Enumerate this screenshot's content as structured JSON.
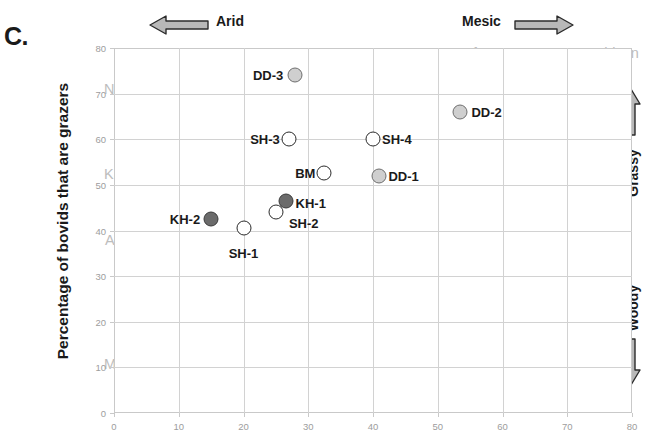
{
  "panel": {
    "letter": "C."
  },
  "axes": {
    "y_title": "Percentage of bovids that are grazers",
    "x_ticks": [
      "0",
      "10",
      "20",
      "30",
      "40",
      "50",
      "60",
      "70",
      "80"
    ],
    "y_ticks": [
      "0",
      "10",
      "20",
      "30",
      "40",
      "50",
      "60",
      "70",
      "80"
    ]
  },
  "annotations": {
    "arid": "Arid",
    "mesic": "Mesic",
    "grassy": "Grassy",
    "woody": "Woody"
  },
  "park_labels": [
    {
      "text": "Ngorongoro",
      "x": 104,
      "y": 81
    },
    {
      "text": "Kalahari",
      "x": 104,
      "y": 166
    },
    {
      "text": "Amboseli",
      "x": 105,
      "y": 232
    },
    {
      "text": "Mkuzi",
      "x": 104,
      "y": 356
    },
    {
      "text": "Chobe",
      "x": 186,
      "y": 194
    },
    {
      "text": "Kruger",
      "x": 176,
      "y": 325
    },
    {
      "text": "Okavango",
      "x": 392,
      "y": 88
    },
    {
      "text": "Kafue",
      "x": 455,
      "y": 45
    },
    {
      "text": "Manyara",
      "x": 504,
      "y": 97
    },
    {
      "text": "Murchison",
      "x": 572,
      "y": 45
    },
    {
      "text": "Falls",
      "x": 592,
      "y": 64
    }
  ],
  "chart_data": {
    "type": "scatter",
    "title": "",
    "xlabel": "",
    "ylabel": "Percentage of bovids that are grazers",
    "xlim": [
      0,
      80
    ],
    "ylim": [
      0,
      80
    ],
    "xticks": [
      0,
      10,
      20,
      30,
      40,
      50,
      60,
      70,
      80
    ],
    "yticks": [
      0,
      10,
      20,
      30,
      40,
      50,
      60,
      70,
      80
    ],
    "grid": true,
    "legend": "none",
    "points": [
      {
        "name": "DD-3",
        "x": 28.0,
        "y": 74.0,
        "style": "light",
        "label_pos": "left",
        "label_dx": -12,
        "label_dy": 0
      },
      {
        "name": "DD-2",
        "x": 53.5,
        "y": 66.0,
        "style": "light",
        "label_pos": "right",
        "label_dx": 11,
        "label_dy": 0
      },
      {
        "name": "SH-3",
        "x": 27.0,
        "y": 60.0,
        "style": "open",
        "label_pos": "left",
        "label_dx": -9,
        "label_dy": 0
      },
      {
        "name": "SH-4",
        "x": 40.0,
        "y": 60.0,
        "style": "open",
        "label_pos": "right",
        "label_dx": 9,
        "label_dy": 0
      },
      {
        "name": "BM",
        "x": 32.5,
        "y": 52.5,
        "style": "open",
        "label_pos": "left",
        "label_dx": -9,
        "label_dy": 0
      },
      {
        "name": "DD-1",
        "x": 41.0,
        "y": 52.0,
        "style": "light",
        "label_pos": "right",
        "label_dx": 9,
        "label_dy": 0
      },
      {
        "name": "KH-1",
        "x": 26.5,
        "y": 46.5,
        "style": "dark",
        "label_pos": "right",
        "label_dx": 10,
        "label_dy": 2
      },
      {
        "name": "SH-2",
        "x": 25.0,
        "y": 44.0,
        "style": "open",
        "label_pos": "right",
        "label_dx": 13,
        "label_dy": 11
      },
      {
        "name": "KH-2",
        "x": 15.0,
        "y": 42.5,
        "style": "dark",
        "label_pos": "left",
        "label_dx": -11,
        "label_dy": 0
      },
      {
        "name": "SH-1",
        "x": 20.0,
        "y": 40.5,
        "style": "open",
        "label_pos": "below",
        "label_dx": 0,
        "label_dy": 18
      }
    ],
    "background_labels": [
      "Ngorongoro",
      "Kalahari",
      "Amboseli",
      "Mkuzi",
      "Chobe",
      "Kruger",
      "Okavango",
      "Kafue",
      "Manyara",
      "Murchison Falls"
    ],
    "direction_annotations": [
      {
        "text": "Arid",
        "axis": "x",
        "direction": "left"
      },
      {
        "text": "Mesic",
        "axis": "x",
        "direction": "right"
      },
      {
        "text": "Grassy",
        "axis": "y",
        "direction": "up"
      },
      {
        "text": "Woody",
        "axis": "y",
        "direction": "down"
      }
    ]
  },
  "colors": {
    "marker_open_fill": "#ffffff",
    "marker_light_fill": "#cfcfcf",
    "marker_dark_fill": "#6b6b6b",
    "marker_stroke": "#2b2b2b",
    "grid": "#d2d2d2",
    "tick_text": "#9d9d9d",
    "park_label": "#bdbdbd",
    "arrow_fill": "#b3b3b3",
    "arrow_stroke": "#2b2b2b"
  }
}
